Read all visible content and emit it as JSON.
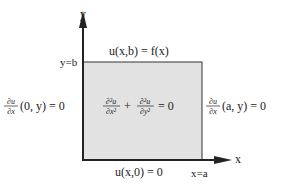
{
  "diagram": {
    "axes": {
      "y_label": "y",
      "x_label": "x",
      "y_tick_label": "y=b",
      "x_tick_label": "x=a"
    },
    "boundary_conditions": {
      "top": "u(x,b) = f(x)",
      "bottom": "u(x,0) = 0",
      "left": {
        "derivative_num": "∂u",
        "derivative_den": "∂x",
        "args": "(0, y) = 0"
      },
      "right": {
        "derivative_num": "∂u",
        "derivative_den": "∂x",
        "args": "(a, y) = 0"
      }
    },
    "pde": {
      "term1_num": "∂²u",
      "term1_den": "∂x²",
      "plus": "+",
      "term2_num": "∂²u",
      "term2_den": "∂y²",
      "rhs": "= 0"
    },
    "colors": {
      "region_fill": "#e2e2e2",
      "line": "#222222",
      "background": "#ffffff"
    }
  }
}
